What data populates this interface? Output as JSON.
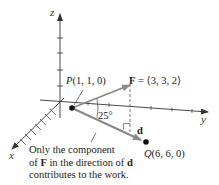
{
  "diagram": {
    "axes": {
      "x_label": "x",
      "y_label": "y",
      "z_label": "z"
    },
    "points": {
      "P": {
        "name": "P",
        "coords": "(1, 1, 0)"
      },
      "Q": {
        "name": "Q",
        "coords": "(6, 6, 0)"
      }
    },
    "force": {
      "symbol": "F",
      "equals": " = ",
      "value": "⟨3, 3, 2⟩"
    },
    "displacement": {
      "symbol": "d"
    },
    "angle": {
      "label": "25°"
    },
    "annotation": {
      "line1": "Only the component",
      "line2_pre": "of ",
      "line2_F": "F",
      "line2_mid": " in the direction of ",
      "line2_d": "d",
      "line3": "contributes to the work."
    },
    "colors": {
      "axis": "#333333",
      "vector": "#8a8a8a",
      "point": "#111111",
      "text": "#222222"
    }
  }
}
